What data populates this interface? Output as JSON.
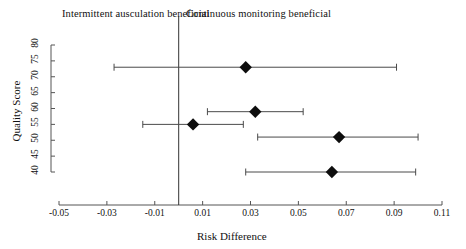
{
  "header": {
    "left_label": "Intermittent ausculation beneficial",
    "right_label": "Continuous monitoring beneficial"
  },
  "chart_data": {
    "type": "scatter",
    "subtype": "forest-plot",
    "title": "",
    "xlabel": "Risk Difference",
    "ylabel": "Quality Score",
    "xlim": [
      -0.05,
      0.11
    ],
    "ylim": [
      40,
      80
    ],
    "grid": false,
    "legend": null,
    "reference_line": {
      "x": 0.0,
      "orientation": "vertical",
      "label": ""
    },
    "xticks": [
      -0.05,
      -0.03,
      -0.01,
      0.01,
      0.03,
      0.05,
      0.07,
      0.09,
      0.11
    ],
    "xtick_labels": [
      "-0.05",
      "-0.03",
      "-0.01",
      "0.01",
      "0.03",
      "0.05",
      "0.07",
      "0.09",
      "0.11"
    ],
    "yticks": [
      40,
      45,
      50,
      55,
      60,
      65,
      70,
      75,
      80
    ],
    "ytick_labels": [
      "40",
      "45",
      "50",
      "55",
      "60",
      "65",
      "70",
      "75",
      "80"
    ],
    "marker": "diamond",
    "points": [
      {
        "y": 73.0,
        "x": 0.028,
        "ci_low": -0.027,
        "ci_high": 0.091
      },
      {
        "y": 59.0,
        "x": 0.032,
        "ci_low": 0.012,
        "ci_high": 0.052
      },
      {
        "y": 55.0,
        "x": 0.006,
        "ci_low": -0.015,
        "ci_high": 0.027
      },
      {
        "y": 51.0,
        "x": 0.067,
        "ci_low": 0.033,
        "ci_high": 0.1
      },
      {
        "y": 40.0,
        "x": 0.064,
        "ci_low": 0.028,
        "ci_high": 0.099
      }
    ]
  }
}
